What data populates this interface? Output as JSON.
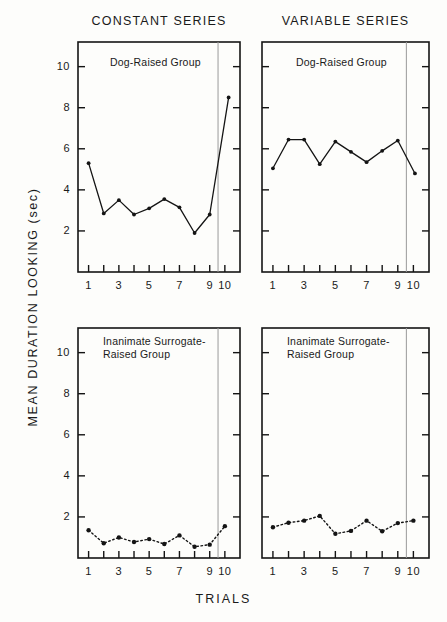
{
  "figure": {
    "xlabel": "TRIALS",
    "ylabel": "MEAN DURATION LOOKING (sec)",
    "column_titles": [
      "CONSTANT SERIES",
      "VARIABLE SERIES"
    ],
    "y_ticks": [
      "2",
      "4",
      "6",
      "8",
      "10"
    ],
    "x_ticks": [
      "1",
      "3",
      "5",
      "7",
      "9",
      "10"
    ],
    "panel_labels": [
      "Dog-Raised Group",
      "Dog-Raised Group",
      "Inanimate Surrogate-\nRaised Group",
      "Inanimate Surrogate-\nRaised Group"
    ],
    "colors": {
      "line": "#141414",
      "frame": "#141414",
      "divider": "#9a9a9a",
      "background": "#fdfdfb"
    }
  },
  "chart_data": [
    {
      "type": "line",
      "title": "CONSTANT SERIES",
      "subtitle": "Dog-Raised Group",
      "panel": "top-left",
      "xlabel": "TRIALS",
      "ylabel": "MEAN DURATION LOOKING (sec)",
      "xlim": [
        0.3,
        11.0
      ],
      "ylim": [
        0,
        11.2
      ],
      "yticks": [
        2,
        4,
        6,
        8,
        10
      ],
      "xticks": [
        1,
        2,
        3,
        4,
        5,
        6,
        7,
        8,
        9,
        10
      ],
      "xticklabels": [
        "1",
        "",
        "3",
        "",
        "5",
        "",
        "7",
        "",
        "9",
        "10"
      ],
      "grid": false,
      "legend": "none",
      "linestyle": "solid",
      "annotations": [
        "vertical divider between trial 9 and trial 10"
      ],
      "x": [
        1,
        2,
        3,
        4,
        5,
        6,
        7,
        8,
        9,
        10.25
      ],
      "values": [
        5.3,
        2.85,
        3.5,
        2.8,
        3.1,
        3.55,
        3.15,
        1.9,
        2.8,
        8.5
      ]
    },
    {
      "type": "line",
      "title": "VARIABLE SERIES",
      "subtitle": "Dog-Raised Group",
      "panel": "top-right",
      "xlabel": "TRIALS",
      "ylabel": "MEAN DURATION LOOKING (sec)",
      "xlim": [
        0.3,
        11.0
      ],
      "ylim": [
        0,
        11.2
      ],
      "yticks": [
        2,
        4,
        6,
        8,
        10
      ],
      "xticks": [
        1,
        2,
        3,
        4,
        5,
        6,
        7,
        8,
        9,
        10
      ],
      "xticklabels": [
        "1",
        "",
        "3",
        "",
        "5",
        "",
        "7",
        "",
        "9",
        "10"
      ],
      "grid": false,
      "legend": "none",
      "linestyle": "solid",
      "annotations": [
        "vertical divider between trial 9 and trial 10"
      ],
      "x": [
        1,
        2,
        3,
        4,
        5,
        6,
        7,
        8,
        9,
        10.1
      ],
      "values": [
        5.05,
        6.45,
        6.45,
        5.25,
        6.35,
        5.85,
        5.35,
        5.9,
        6.4,
        4.8
      ]
    },
    {
      "type": "line",
      "title": "CONSTANT SERIES",
      "subtitle": "Inanimate Surrogate-Raised Group",
      "panel": "bottom-left",
      "xlabel": "TRIALS",
      "ylabel": "MEAN DURATION LOOKING (sec)",
      "xlim": [
        0.3,
        11.0
      ],
      "ylim": [
        0,
        11.2
      ],
      "yticks": [
        2,
        4,
        6,
        8,
        10
      ],
      "xticks": [
        1,
        2,
        3,
        4,
        5,
        6,
        7,
        8,
        9,
        10
      ],
      "xticklabels": [
        "1",
        "",
        "3",
        "",
        "5",
        "",
        "7",
        "",
        "9",
        "10"
      ],
      "grid": false,
      "legend": "none",
      "linestyle": "dotted",
      "annotations": [
        "vertical divider between trial 9 and trial 10"
      ],
      "x": [
        1,
        2,
        3,
        4,
        5,
        6,
        7,
        8,
        9,
        10
      ],
      "values": [
        1.35,
        0.72,
        1.0,
        0.78,
        0.92,
        0.68,
        1.1,
        0.55,
        0.65,
        1.55
      ]
    },
    {
      "type": "line",
      "title": "VARIABLE SERIES",
      "subtitle": "Inanimate Surrogate-Raised Group",
      "panel": "bottom-right",
      "xlabel": "TRIALS",
      "ylabel": "MEAN DURATION LOOKING (sec)",
      "xlim": [
        0.3,
        11.0
      ],
      "ylim": [
        0,
        11.2
      ],
      "yticks": [
        2,
        4,
        6,
        8,
        10
      ],
      "xticks": [
        1,
        2,
        3,
        4,
        5,
        6,
        7,
        8,
        9,
        10
      ],
      "xticklabels": [
        "1",
        "",
        "3",
        "",
        "5",
        "",
        "7",
        "",
        "9",
        "10"
      ],
      "grid": false,
      "legend": "none",
      "linestyle": "dotted",
      "annotations": [
        "vertical divider between trial 9 and trial 10"
      ],
      "x": [
        1,
        2,
        3,
        4,
        5,
        6,
        7,
        8,
        9,
        10
      ],
      "values": [
        1.5,
        1.72,
        1.82,
        2.05,
        1.18,
        1.32,
        1.82,
        1.3,
        1.7,
        1.82
      ]
    }
  ]
}
